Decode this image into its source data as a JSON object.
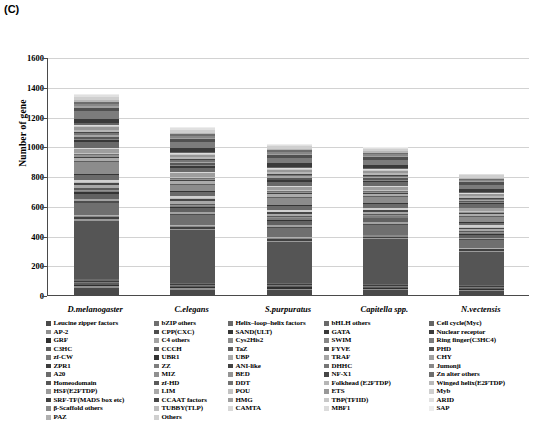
{
  "panel": {
    "letter": "(C)"
  },
  "chart_data": {
    "type": "bar",
    "stacked": true,
    "title": "",
    "xlabel": "",
    "ylabel": "Number of gene",
    "ylim": [
      0,
      1600
    ],
    "yticks": [
      0,
      200,
      400,
      600,
      800,
      1000,
      1200,
      1400,
      1600
    ],
    "grid": true,
    "legend_position": "bottom",
    "categories": [
      "D.melanogaster",
      "C.elegans",
      "S.purpuratus",
      "Capitella spp.",
      "N.vectensis"
    ],
    "totals": [
      1355,
      1130,
      1020,
      1000,
      820
    ],
    "series": [
      {
        "name": "Leucine zipper factors",
        "color": "#4a4a4a",
        "values": [
          52,
          40,
          34,
          35,
          26
        ]
      },
      {
        "name": "AP-2",
        "color": "#8f8f8f",
        "values": [
          18,
          12,
          14,
          12,
          10
        ]
      },
      {
        "name": "GRF",
        "color": "#2e2e2e",
        "values": [
          9,
          7,
          8,
          7,
          6
        ]
      },
      {
        "name": "C3HC",
        "color": "#5c5c5c",
        "values": [
          14,
          10,
          10,
          9,
          7
        ]
      },
      {
        "name": "zf-CW",
        "color": "#7a7a7a",
        "values": [
          8,
          6,
          7,
          6,
          5
        ]
      },
      {
        "name": "ZPR1",
        "color": "#3c3c3c",
        "values": [
          10,
          9,
          8,
          8,
          6
        ]
      },
      {
        "name": "A20",
        "color": "#6b6b6b",
        "values": [
          12,
          9,
          10,
          9,
          7
        ]
      },
      {
        "name": "Homeodomain",
        "color": "#555555",
        "values": [
          462,
          398,
          300,
          330,
          230
        ]
      },
      {
        "name": "HSF(E2FTDP)",
        "color": "#9a9a9a",
        "values": [
          14,
          11,
          10,
          10,
          8
        ]
      },
      {
        "name": "SRF-TF(MADS box etc)",
        "color": "#404040",
        "values": [
          16,
          13,
          12,
          11,
          9
        ]
      },
      {
        "name": "β-Scaffold others",
        "color": "#8a8a8a",
        "values": [
          10,
          8,
          9,
          8,
          6
        ]
      },
      {
        "name": "PAZ",
        "color": "#b0b0b0",
        "values": [
          8,
          7,
          7,
          6,
          5
        ]
      },
      {
        "name": "bZIP others",
        "color": "#6f6f6f",
        "values": [
          95,
          74,
          68,
          70,
          52
        ]
      },
      {
        "name": "CPP(CXC)",
        "color": "#4d4d4d",
        "values": [
          12,
          10,
          9,
          9,
          7
        ]
      },
      {
        "name": "C4 others",
        "color": "#a2a2a2",
        "values": [
          16,
          13,
          12,
          12,
          9
        ]
      },
      {
        "name": "CCCH",
        "color": "#616161",
        "values": [
          44,
          35,
          32,
          30,
          24
        ]
      },
      {
        "name": "UBR1",
        "color": "#333333",
        "values": [
          10,
          8,
          8,
          7,
          6
        ]
      },
      {
        "name": "ZZ",
        "color": "#7e7e7e",
        "values": [
          12,
          9,
          9,
          9,
          7
        ]
      },
      {
        "name": "MIZ",
        "color": "#909090",
        "values": [
          9,
          7,
          7,
          7,
          5
        ]
      },
      {
        "name": "zf-HD",
        "color": "#5a5a5a",
        "values": [
          11,
          9,
          8,
          8,
          6
        ]
      },
      {
        "name": "LIM",
        "color": "#a8a8a8",
        "values": [
          26,
          22,
          20,
          19,
          15
        ]
      },
      {
        "name": "CCAAT factors",
        "color": "#474747",
        "values": [
          14,
          11,
          10,
          10,
          8
        ]
      },
      {
        "name": "TUBBY(TLP)",
        "color": "#bdbdbd",
        "values": [
          8,
          7,
          6,
          6,
          5
        ]
      },
      {
        "name": "Others",
        "color": "#d0d0d0",
        "values": [
          20,
          16,
          15,
          14,
          11
        ]
      },
      {
        "name": "Helix–loop–helix factors",
        "color": "#6a6a6a",
        "values": [
          38,
          30,
          28,
          26,
          20
        ]
      },
      {
        "name": "SAND(ULT)",
        "color": "#353535",
        "values": [
          10,
          8,
          8,
          7,
          6
        ]
      },
      {
        "name": "Cys2His2",
        "color": "#8c8c8c",
        "values": [
          90,
          48,
          52,
          46,
          34
        ]
      },
      {
        "name": "TaZ",
        "color": "#5e5e5e",
        "values": [
          9,
          8,
          7,
          7,
          5
        ]
      },
      {
        "name": "UBP",
        "color": "#ababab",
        "values": [
          24,
          20,
          18,
          17,
          13
        ]
      },
      {
        "name": "ANI-like",
        "color": "#424242",
        "values": [
          12,
          10,
          9,
          9,
          7
        ]
      },
      {
        "name": "BED",
        "color": "#949494",
        "values": [
          10,
          8,
          8,
          7,
          6
        ]
      },
      {
        "name": "DDT",
        "color": "#717171",
        "values": [
          9,
          7,
          7,
          6,
          5
        ]
      },
      {
        "name": "POU",
        "color": "#c2c2c2",
        "values": [
          11,
          9,
          8,
          8,
          6
        ]
      },
      {
        "name": "HMG",
        "color": "#9e9e9e",
        "values": [
          30,
          25,
          22,
          21,
          16
        ]
      },
      {
        "name": "CAMTA",
        "color": "#d8d8d8",
        "values": [
          8,
          7,
          6,
          6,
          5
        ]
      },
      {
        "name": "bHLH others",
        "color": "#696969",
        "values": [
          46,
          36,
          33,
          31,
          24
        ]
      },
      {
        "name": "GATA",
        "color": "#383838",
        "values": [
          14,
          11,
          10,
          10,
          8
        ]
      },
      {
        "name": "SWIM",
        "color": "#868686",
        "values": [
          9,
          7,
          7,
          6,
          5
        ]
      },
      {
        "name": "FYVE",
        "color": "#585858",
        "values": [
          18,
          15,
          13,
          13,
          10
        ]
      },
      {
        "name": "TRAF",
        "color": "#a5a5a5",
        "values": [
          16,
          13,
          12,
          11,
          9
        ]
      },
      {
        "name": "DHHC",
        "color": "#767676",
        "values": [
          13,
          10,
          10,
          9,
          7
        ]
      },
      {
        "name": "NF-X1",
        "color": "#464646",
        "values": [
          8,
          7,
          6,
          6,
          5
        ]
      },
      {
        "name": "Folkhead (E2FTDP)",
        "color": "#b6b6b6",
        "values": [
          20,
          16,
          15,
          14,
          11
        ]
      },
      {
        "name": "ETS",
        "color": "#989898",
        "values": [
          22,
          18,
          16,
          15,
          12
        ]
      },
      {
        "name": "TBP(TFIID)",
        "color": "#c8c8c8",
        "values": [
          10,
          8,
          8,
          7,
          6
        ]
      },
      {
        "name": "MBF1",
        "color": "#dcdcdc",
        "values": [
          8,
          7,
          6,
          6,
          5
        ]
      },
      {
        "name": "Cell cycle(Myc)",
        "color": "#646464",
        "values": [
          12,
          10,
          9,
          9,
          7
        ]
      },
      {
        "name": "Nuclear receptor",
        "color": "#3a3a3a",
        "values": [
          36,
          28,
          26,
          24,
          19
        ]
      },
      {
        "name": "Ring finger(C3HC4)",
        "color": "#7c7c7c",
        "values": [
          58,
          46,
          42,
          40,
          31
        ]
      },
      {
        "name": "PHD",
        "color": "#505050",
        "values": [
          30,
          24,
          22,
          21,
          16
        ]
      },
      {
        "name": "CHY",
        "color": "#a0a0a0",
        "values": [
          10,
          8,
          8,
          7,
          6
        ]
      },
      {
        "name": "Jumonji",
        "color": "#888888",
        "values": [
          16,
          13,
          12,
          11,
          9
        ]
      },
      {
        "name": "Zn alter others",
        "color": "#6d6d6d",
        "values": [
          18,
          15,
          13,
          13,
          10
        ]
      },
      {
        "name": "Winged helix(E2FTDP)",
        "color": "#b8b8b8",
        "values": [
          14,
          11,
          10,
          10,
          8
        ]
      },
      {
        "name": "Myb",
        "color": "#cfcfcf",
        "values": [
          28,
          22,
          20,
          19,
          15
        ]
      },
      {
        "name": "ARID",
        "color": "#e0e0e0",
        "values": [
          12,
          10,
          9,
          9,
          7
        ]
      },
      {
        "name": "SAP",
        "color": "#ededed",
        "values": [
          10,
          8,
          8,
          7,
          6
        ]
      }
    ]
  },
  "legend": {
    "columns": [
      {
        "items": [
          "Leucine zipper factors",
          "AP-2",
          "GRF",
          "C3HC",
          "zf-CW",
          "ZPR1",
          "A20",
          "Homeodomain",
          "HSF(E2FTDP)",
          "SRF-TF(MADS box etc)",
          "β-Scaffold others",
          "PAZ"
        ]
      },
      {
        "items": [
          "bZIP others",
          "CPP(CXC)",
          "C4 others",
          "CCCH",
          "UBR1",
          "ZZ",
          "MIZ",
          "zf-HD",
          "LIM",
          "CCAAT factors",
          "TUBBY(TLP)",
          "Others"
        ]
      },
      {
        "items": [
          "Helix–loop–helix factors",
          "SAND(ULT)",
          "Cys2His2",
          "TaZ",
          "UBP",
          "ANI-like",
          "BED",
          "DDT",
          "POU",
          "HMG",
          "CAMTA"
        ]
      },
      {
        "items": [
          "bHLH others",
          "GATA",
          "SWIM",
          "FYVE",
          "TRAF",
          "DHHC",
          "NF-X1",
          "Folkhead (E2FTDP)",
          "ETS",
          "TBP(TFIID)",
          "MBF1"
        ]
      },
      {
        "items": [
          "Cell cycle(Myc)",
          "Nuclear receptor",
          "Ring finger(C3HC4)",
          "PHD",
          "CHY",
          "Jumonji",
          "Zn alter others",
          "Winged helix(E2FTDP)",
          "Myb",
          "ARID",
          "SAP"
        ]
      }
    ]
  }
}
